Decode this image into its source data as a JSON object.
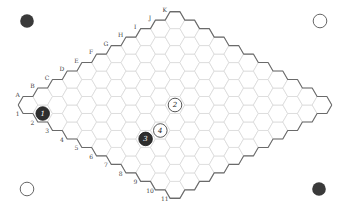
{
  "game": {
    "type": "Hex",
    "size": 11,
    "letters": [
      "A",
      "B",
      "C",
      "D",
      "E",
      "F",
      "G",
      "H",
      "I",
      "J",
      "K"
    ],
    "numbers": [
      "1",
      "2",
      "3",
      "4",
      "5",
      "6",
      "7",
      "8",
      "9",
      "10",
      "11"
    ],
    "colors": {
      "black": "#2e2e2e",
      "white": "#ffffff",
      "grid": "#d9d9d9",
      "edge": "#6a6a6a"
    }
  },
  "stones": [
    {
      "move": "1",
      "color": "black",
      "cell": "A2"
    },
    {
      "move": "2",
      "color": "white",
      "cell": "F6"
    },
    {
      "move": "3",
      "color": "black",
      "cell": "C7"
    },
    {
      "move": "4",
      "color": "white",
      "cell": "D7"
    }
  ],
  "corner_markers": [
    {
      "position": "top-left",
      "color": "black"
    },
    {
      "position": "top-right",
      "color": "white"
    },
    {
      "position": "bottom-left",
      "color": "white"
    },
    {
      "position": "bottom-right",
      "color": "black"
    }
  ]
}
